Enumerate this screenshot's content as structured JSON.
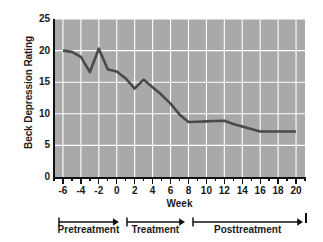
{
  "chart_data": {
    "type": "line",
    "title": "",
    "xlabel": "Week",
    "ylabel": "Beck Depression Rating",
    "xlim": [
      -7,
      21
    ],
    "ylim": [
      0,
      25
    ],
    "xticks": [
      -6,
      -4,
      -2,
      0,
      2,
      4,
      6,
      8,
      10,
      12,
      14,
      16,
      18,
      20
    ],
    "xtick_labels": [
      "-6",
      "-4",
      "-2",
      "0",
      "2",
      "4",
      "6",
      "8",
      "10",
      "12",
      "14",
      "16",
      "18",
      "20"
    ],
    "xtick_minor_step": 1,
    "yticks": [
      0,
      5,
      10,
      15,
      20,
      25
    ],
    "ytick_labels": [
      "0",
      "5",
      "10",
      "15",
      "20",
      "25"
    ],
    "grid": true,
    "grid_color": "#ffffff",
    "plot_bgcolor": "#a9a9a9",
    "line_color": "#4a4a4a",
    "line_width": 2.6,
    "series": [
      {
        "name": "Beck Depression Rating",
        "x": [
          -6,
          -5,
          -4,
          -3,
          -2,
          -1,
          0,
          1,
          2,
          3,
          4,
          5,
          6,
          7,
          8,
          9,
          10,
          11,
          12,
          13,
          14,
          15,
          16,
          17,
          18,
          19,
          20
        ],
        "values": [
          20.0,
          19.8,
          19.0,
          16.6,
          20.3,
          17.0,
          16.7,
          15.6,
          14.0,
          15.4,
          14.2,
          13.0,
          11.6,
          9.9,
          8.7,
          8.75,
          8.8,
          8.85,
          8.9,
          8.4,
          8.0,
          7.6,
          7.2,
          7.2,
          7.2,
          7.2,
          7.2
        ]
      }
    ],
    "annotations": [
      {
        "label": "Pretreatment",
        "from_week": -6.6,
        "to_week": 0.2,
        "arrow": "right"
      },
      {
        "label": "Treatment",
        "from_week": 1.0,
        "to_week": 7.6,
        "arrow": "right"
      },
      {
        "label": "Posttreatment",
        "from_week": 8.4,
        "to_week": 20.8,
        "arrow": "right"
      }
    ]
  },
  "axes": {
    "y_title": "Beck Depression Rating",
    "x_title": "Week"
  }
}
